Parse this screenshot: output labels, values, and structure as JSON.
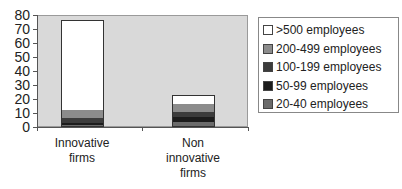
{
  "chart_data": {
    "type": "bar",
    "stacked": true,
    "title": "",
    "xlabel": "",
    "ylabel": "",
    "ylim": [
      0,
      80
    ],
    "yticks": [
      0,
      10,
      20,
      30,
      40,
      50,
      60,
      70,
      80
    ],
    "grid": false,
    "legend_position": "right",
    "categories": [
      "Innovative firms",
      "Non innovative firms"
    ],
    "series": [
      {
        "name": "20-40 employees",
        "color": "#6b6b6b",
        "values": [
          1,
          3
        ]
      },
      {
        "name": "50-99 employees",
        "color": "#1c1c1c",
        "values": [
          1.5,
          3.5
        ]
      },
      {
        "name": "100-199 employees",
        "color": "#3c3c3c",
        "values": [
          3,
          4
        ]
      },
      {
        "name": "200-499 employees",
        "color": "#8c8c8c",
        "values": [
          6,
          6.5
        ]
      },
      {
        "name": ">500 employees",
        "color": "#ffffff",
        "values": [
          65,
          6
        ]
      }
    ]
  },
  "axis": {
    "y_labels": [
      "0",
      "10",
      "20",
      "30",
      "40",
      "50",
      "60",
      "70",
      "80"
    ]
  },
  "x_labels": [
    {
      "line1": "Innovative",
      "line2": "firms",
      "line3": ""
    },
    {
      "line1": "Non",
      "line2": "innovative",
      "line3": "firms"
    }
  ],
  "legend": [
    {
      "label": ">500 employees",
      "color": "#ffffff"
    },
    {
      "label": "200-499 employees",
      "color": "#8c8c8c"
    },
    {
      "label": "100-199 employees",
      "color": "#3c3c3c"
    },
    {
      "label": "50-99 employees",
      "color": "#1c1c1c"
    },
    {
      "label": "20-40 employees",
      "color": "#6b6b6b"
    }
  ]
}
